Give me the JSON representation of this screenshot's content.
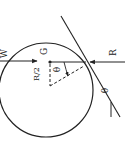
{
  "figure": {
    "type": "physics free-body diagram (rotated 90°)",
    "labels": {
      "left_force": "W",
      "center": "G",
      "right_force": "R",
      "offset": "R/2",
      "angle_inner": "θ",
      "angle_incline": "θ"
    },
    "colors": {
      "ink": "#222222",
      "background": "#ffffff"
    }
  }
}
